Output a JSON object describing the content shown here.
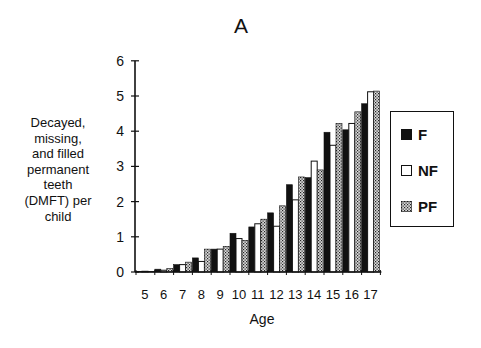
{
  "chart_data": {
    "type": "bar",
    "title": "A",
    "xlabel": "Age",
    "ylabel": "Decayed, missing, and filled permanent teeth (DMFT) per child",
    "ylabel_lines": [
      "Decayed,",
      "missing,",
      "and filled",
      "permanent",
      "teeth",
      "(DMFT) per",
      "child"
    ],
    "ylim": [
      0,
      6
    ],
    "yticks": [
      "0",
      "1",
      "2",
      "3",
      "4",
      "5",
      "6"
    ],
    "categories": [
      "5",
      "6",
      "7",
      "8",
      "9",
      "10",
      "11",
      "12",
      "13",
      "14",
      "15",
      "16",
      "17"
    ],
    "series": [
      {
        "name": "F",
        "fill": "#111111",
        "pattern": "solid",
        "values": [
          0.02,
          0.08,
          0.21,
          0.4,
          0.65,
          1.1,
          1.28,
          1.68,
          2.48,
          2.68,
          3.97,
          4.04,
          4.78
        ]
      },
      {
        "name": "NF",
        "fill": "#ffffff",
        "pattern": "outline",
        "values": [
          0.02,
          0.05,
          0.21,
          0.3,
          0.65,
          0.95,
          1.37,
          1.3,
          2.05,
          3.15,
          3.6,
          4.22,
          5.12
        ]
      },
      {
        "name": "PF",
        "fill": "#7a7a7a",
        "pattern": "stipple",
        "values": [
          0.02,
          0.1,
          0.28,
          0.65,
          0.73,
          0.9,
          1.5,
          1.88,
          2.7,
          2.9,
          4.22,
          4.55,
          5.14
        ]
      }
    ],
    "legend": {
      "position": "right",
      "entries": [
        "F",
        "NF",
        "PF"
      ]
    },
    "grid": false
  }
}
